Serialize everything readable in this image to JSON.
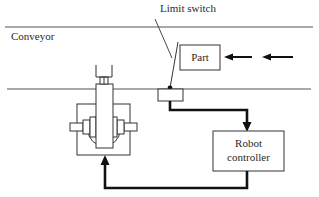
{
  "diagram": {
    "type": "robot-conveyor-control-schematic",
    "labels": {
      "limit_switch": "Limit switch",
      "conveyor": "Conveyor",
      "part": "Part",
      "controller_line1": "Robot",
      "controller_line2": "controller"
    },
    "flow": [
      {
        "from": "part",
        "to": "limit_switch",
        "kind": "motion-arrows",
        "direction": "left"
      },
      {
        "from": "limit_switch",
        "to": "robot_controller",
        "kind": "signal-wire"
      },
      {
        "from": "robot_controller",
        "to": "robot",
        "kind": "signal-wire"
      }
    ],
    "colors": {
      "line": "#3a3a3a",
      "wire": "#1a1a1a",
      "background": "#ffffff"
    }
  }
}
